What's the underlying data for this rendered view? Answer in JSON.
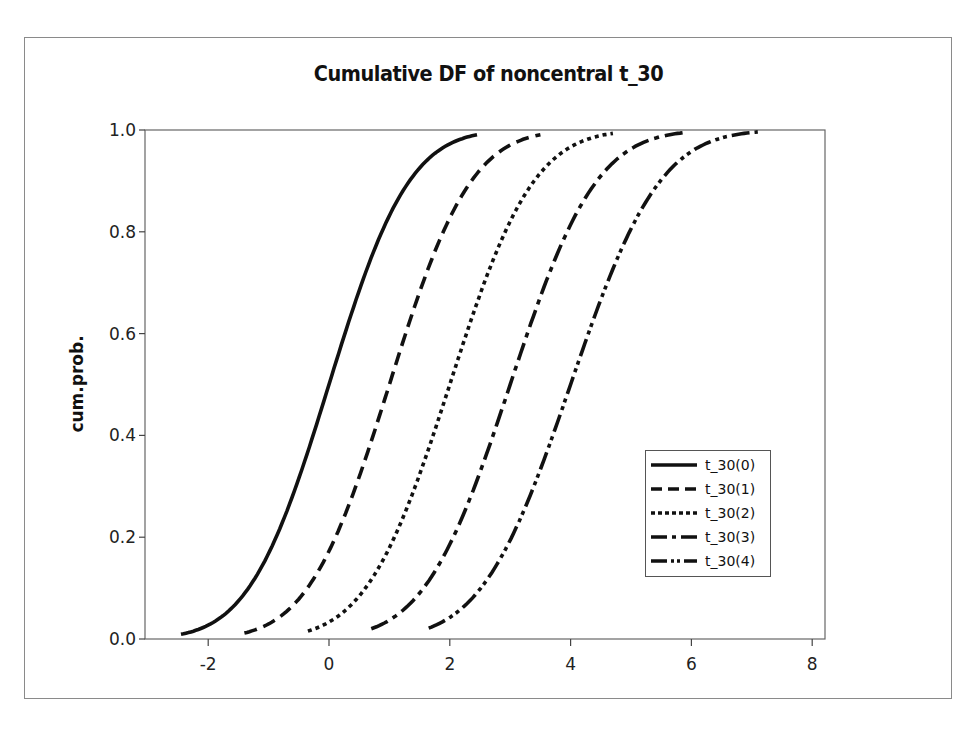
{
  "chart_data": {
    "type": "line",
    "title": "Cumulative DF of noncentral t_30",
    "xlabel": "",
    "ylabel": "cum.prob.",
    "xlim": [
      -3.0,
      8.2
    ],
    "ylim": [
      0.0,
      1.0
    ],
    "x_ticks": [
      -2,
      0,
      2,
      4,
      6,
      8
    ],
    "y_ticks": [
      "0.0",
      "0.2",
      "0.4",
      "0.6",
      "0.8",
      "1.0"
    ],
    "grid": false,
    "legend_position": "lower right",
    "series": [
      {
        "name": "t_30(0)",
        "ncp": 0,
        "dash": "solid",
        "x_range": [
          -2.45,
          2.45
        ],
        "sd": 1.04
      },
      {
        "name": "t_30(1)",
        "ncp": 1,
        "dash": "dash",
        "x_range": [
          -1.4,
          3.5
        ],
        "sd": 1.06
      },
      {
        "name": "t_30(2)",
        "ncp": 2,
        "dash": "dot",
        "x_range": [
          -0.35,
          4.7
        ],
        "sd": 1.09
      },
      {
        "name": "t_30(3)",
        "ncp": 3,
        "dash": "dashdot",
        "x_range": [
          0.7,
          5.9
        ],
        "sd": 1.12
      },
      {
        "name": "t_30(4)",
        "ncp": 4,
        "dash": "dashdotdot",
        "x_range": [
          1.65,
          7.1
        ],
        "sd": 1.16
      }
    ]
  },
  "title": "Cumulative DF of noncentral t_30",
  "ylabel": "cum.prob.",
  "legend": [
    "t_30(0)",
    "t_30(1)",
    "t_30(2)",
    "t_30(3)",
    "t_30(4)"
  ]
}
